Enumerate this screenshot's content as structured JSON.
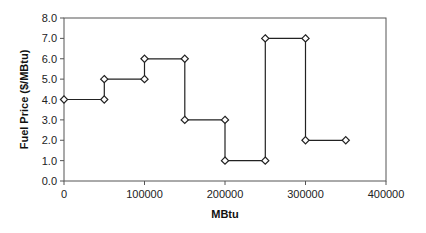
{
  "chart_data": {
    "type": "line",
    "subtype": "step",
    "title": "",
    "xlabel": "MBtu",
    "ylabel": "Fuel Price ($/MBtu)",
    "xlim": [
      0,
      400000
    ],
    "ylim": [
      0,
      8
    ],
    "x_ticks": [
      "0",
      "100000",
      "200000",
      "300000",
      "400000"
    ],
    "y_ticks": [
      "0.0",
      "1.0",
      "2.0",
      "3.0",
      "4.0",
      "5.0",
      "6.0",
      "7.0",
      "8.0"
    ],
    "grid": false,
    "legend": null,
    "marker": "diamond-open",
    "series": [
      {
        "name": "Fuel Price",
        "x": [
          0,
          50000,
          50000,
          100000,
          100000,
          150000,
          150000,
          200000,
          200000,
          250000,
          250000,
          300000,
          300000,
          350000
        ],
        "y": [
          4,
          4,
          5,
          5,
          6,
          6,
          3,
          3,
          1,
          1,
          7,
          7,
          2,
          2
        ]
      }
    ]
  }
}
